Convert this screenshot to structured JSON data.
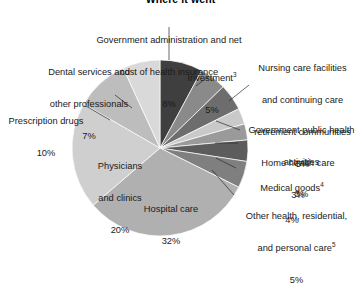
{
  "chart_title": "Where it went",
  "chart_data": {
    "type": "pie",
    "title": "Where it went",
    "xlabel": "",
    "ylabel": "",
    "unit": "percent",
    "legend_position": "callout-labels",
    "grid": false,
    "start_angle_deg": 0,
    "direction": "clockwise",
    "categories": [
      "Government administration and net cost of health insurance",
      "Investment",
      "Nursing care facilities and continuing care retirement communities",
      "Government public health activities",
      "Home health care",
      "Medical goods",
      "Other health, residential, and personal care",
      "Hospital care",
      "Physicians and clinics",
      "Prescription drugs",
      "Dental services and other professionals"
    ],
    "values": [
      8,
      5,
      5,
      3,
      3,
      4,
      5,
      32,
      20,
      10,
      7
    ],
    "colors": [
      "#3f3f3f",
      "#8a8a8a",
      "#6d6d6d",
      "#c9c9c9",
      "#9a9a9a",
      "#5c5c5c",
      "#7f7f7f",
      "#b0b0b0",
      "#cfcfcf",
      "#bdbdbd",
      "#d9d9d9"
    ],
    "slices": [
      {
        "label": "Government administration and net cost of health insurance",
        "value": 8,
        "value_label": "8%",
        "color": "#3f3f3f"
      },
      {
        "label": "Investment",
        "value": 5,
        "value_label": "5%",
        "color": "#8a8a8a",
        "footnote": "3"
      },
      {
        "label": "Nursing care facilities and continuing care retirement communities",
        "value": 5,
        "value_label": "5%",
        "color": "#6d6d6d"
      },
      {
        "label": "Government public health activities",
        "value": 3,
        "value_label": "3%",
        "color": "#c9c9c9"
      },
      {
        "label": "Home health care",
        "value": 3,
        "value_label": "3%",
        "color": "#9a9a9a"
      },
      {
        "label": "Medical goods",
        "value": 4,
        "value_label": "4%",
        "color": "#5c5c5c",
        "footnote": "4"
      },
      {
        "label": "Other health, residential, and personal care",
        "value": 5,
        "value_label": "5%",
        "color": "#7f7f7f",
        "footnote": "5"
      },
      {
        "label": "Hospital care",
        "value": 32,
        "value_label": "32%",
        "color": "#b0b0b0"
      },
      {
        "label": "Physicians and clinics",
        "value": 20,
        "value_label": "20%",
        "color": "#cfcfcf"
      },
      {
        "label": "Prescription drugs",
        "value": 10,
        "value_label": "10%",
        "color": "#bdbdbd"
      },
      {
        "label": "Dental services and other professionals",
        "value": 7,
        "value_label": "7%",
        "color": "#d9d9d9"
      }
    ]
  },
  "labels": {
    "gov_admin": {
      "line1": "Government administration and net",
      "line2": "cost of health insurance",
      "value": "8%"
    },
    "investment": {
      "line1": "Investment",
      "footnote": "3",
      "value": "5%"
    },
    "nursing": {
      "line1": "Nursing care facilities",
      "line2": "and continuing care",
      "line3": "retirement communities",
      "value": "5%"
    },
    "gov_public_health": {
      "line1": "Government public health",
      "line2": "activities",
      "value": "3%"
    },
    "home_health": {
      "line1": "Home health care",
      "value": "3%"
    },
    "medical_goods": {
      "line1": "Medical goods",
      "footnote": "4",
      "value": "4%"
    },
    "other_health": {
      "line1": "Other health, residential,",
      "line2": "and personal care",
      "footnote": "5",
      "value": "5%"
    },
    "hospital_care": {
      "line1": "Hospital care",
      "value": "32%"
    },
    "physicians": {
      "line1": "Physicians",
      "line2": "and clinics",
      "value": "20%"
    },
    "prescription_drugs": {
      "line1": "Prescription drugs",
      "value": "10%"
    },
    "dental": {
      "line1": "Dental services and",
      "line2": "other professionals",
      "value": "7%"
    }
  }
}
